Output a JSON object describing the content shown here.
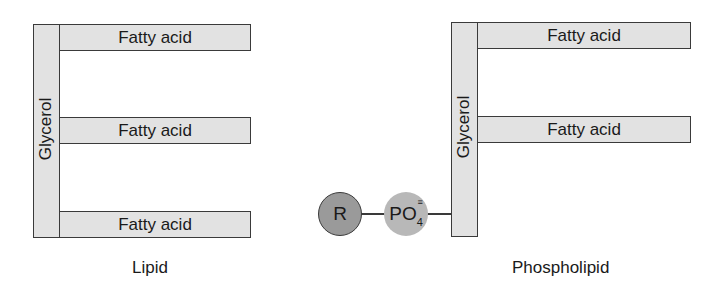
{
  "lipid": {
    "glycerol_label": "Glycerol",
    "fatty_acids": [
      "Fatty acid",
      "Fatty acid",
      "Fatty acid"
    ],
    "caption": "Lipid"
  },
  "phospholipid": {
    "glycerol_label": "Glycerol",
    "fatty_acids": [
      "Fatty acid",
      "Fatty acid"
    ],
    "r_group_label": "R",
    "phosphate_label": "PO",
    "phosphate_subscript": "4",
    "phosphate_charge": "≡",
    "caption": "Phospholipid"
  },
  "colors": {
    "box_fill": "#e2e2e2",
    "outline": "#3a3a3a",
    "r_group_fill": "#9a9a9a",
    "phosphate_fill": "#b8b8b8"
  }
}
